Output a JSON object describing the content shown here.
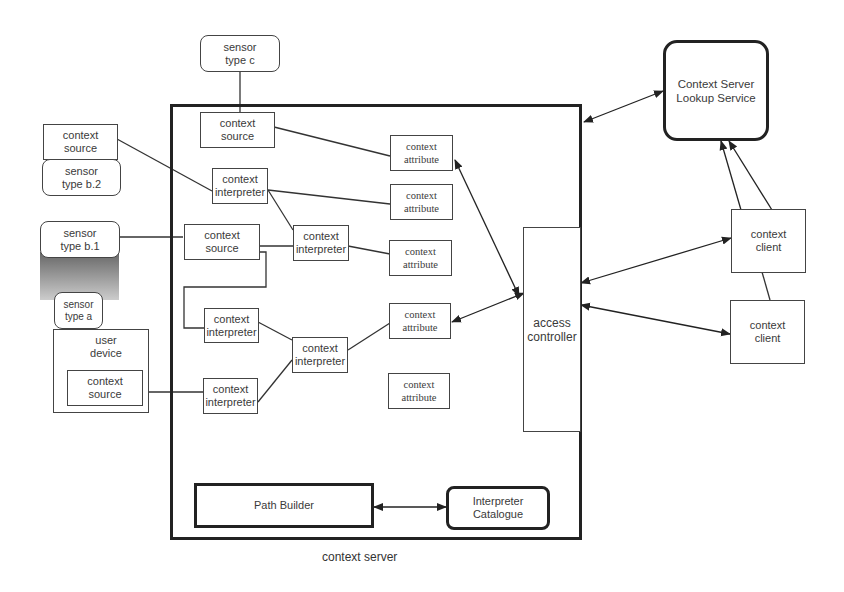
{
  "title": "context server",
  "external": {
    "sensor_c": [
      "sensor",
      "type c"
    ],
    "ext_context_source": [
      "context",
      "source"
    ],
    "sensor_b2": [
      "sensor",
      "type b.2"
    ],
    "sensor_b1": [
      "sensor",
      "type b.1"
    ],
    "sensor_a": [
      "sensor",
      "type a"
    ],
    "user_device": [
      "user",
      "device"
    ],
    "device_context_source": [
      "context",
      "source"
    ],
    "lookup_service": [
      "Context Server",
      "Lookup Service"
    ],
    "client_1": [
      "context",
      "client"
    ],
    "client_2": [
      "context",
      "client"
    ]
  },
  "server": {
    "label": "context server",
    "context_source_top": [
      "context",
      "source"
    ],
    "interpreter_1": [
      "context",
      "interpreter"
    ],
    "context_source_mid": [
      "context",
      "source"
    ],
    "interpreter_2": [
      "context",
      "interpreter"
    ],
    "interpreter_3": [
      "context",
      "interpreter"
    ],
    "interpreter_4": [
      "context",
      "interpreter"
    ],
    "interpreter_5": [
      "context",
      "interpreter"
    ],
    "attributes": [
      [
        "context",
        "attribute"
      ],
      [
        "context",
        "attribute"
      ],
      [
        "context",
        "attribute"
      ],
      [
        "context",
        "attribute"
      ],
      [
        "context",
        "attribute"
      ]
    ],
    "access_controller": [
      "access",
      "controller"
    ],
    "path_builder": "Path Builder",
    "interpreter_catalogue": [
      "Interpreter",
      "Catalogue"
    ]
  }
}
